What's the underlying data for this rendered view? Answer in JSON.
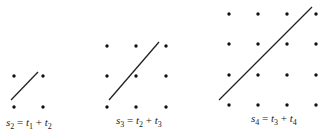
{
  "diagrams": [
    {
      "id": "grid-2x2",
      "size": 2,
      "x": [
        14,
        43
      ],
      "y": [
        76,
        107
      ],
      "line": {
        "x1": 11,
        "y1": 100,
        "x2": 38,
        "y2": 72
      },
      "label": {
        "x": 6,
        "y": 126,
        "s": "s",
        "s_sub": "2",
        "t1": "t",
        "t1_sub": "1",
        "t2": "t",
        "t2_sub": "2"
      }
    },
    {
      "id": "grid-3x3",
      "size": 3,
      "x": [
        107,
        136,
        166
      ],
      "y": [
        46,
        76,
        107
      ],
      "line": {
        "x1": 109,
        "y1": 100,
        "x2": 159,
        "y2": 42
      },
      "label": {
        "x": 116,
        "y": 124,
        "s": "s",
        "s_sub": "3",
        "t1": "t",
        "t1_sub": "2",
        "t2": "t",
        "t2_sub": "3"
      }
    },
    {
      "id": "grid-4x4",
      "size": 4,
      "x": [
        229,
        258,
        287,
        316
      ],
      "y": [
        14,
        44,
        75,
        105
      ],
      "line": {
        "x1": 219,
        "y1": 100,
        "x2": 312,
        "y2": 7
      },
      "label": {
        "x": 251,
        "y": 122,
        "s": "s",
        "s_sub": "4",
        "t1": "t",
        "t1_sub": "3",
        "t2": "t",
        "t2_sub": "4"
      }
    }
  ],
  "colors": {
    "dot": "#111111",
    "line": "#222222",
    "text": "#222222"
  }
}
